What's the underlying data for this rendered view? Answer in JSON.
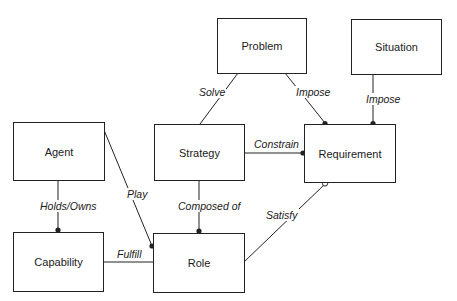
{
  "diagram": {
    "nodes": {
      "problem": "Problem",
      "situation": "Situation",
      "agent": "Agent",
      "strategy": "Strategy",
      "requirement": "Requirement",
      "capability": "Capability",
      "role": "Role"
    },
    "edges": {
      "solve": "Solve",
      "impose_problem": "Impose",
      "impose_situation": "Impose",
      "constrain": "Constrain",
      "play": "Play",
      "holds_owns": "Holds/Owns",
      "composed_of": "Composed of",
      "satisfy": "Satisfy",
      "fulfill": "Fulfill"
    },
    "colors": {
      "line": "#222222",
      "background": "#ffffff"
    }
  }
}
